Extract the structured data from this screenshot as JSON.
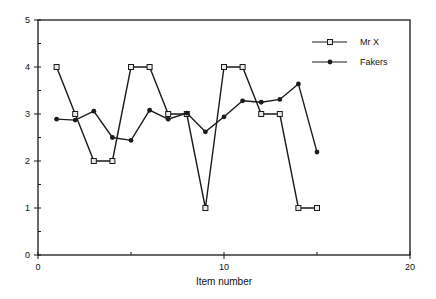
{
  "chart_data": {
    "type": "line",
    "title": "",
    "xlabel": "Item number",
    "ylabel": "",
    "xlim": [
      0,
      20
    ],
    "ylim": [
      0,
      5
    ],
    "x_ticks": [
      0,
      10,
      20
    ],
    "x_minor_ticks": [
      5,
      15
    ],
    "y_ticks": [
      0,
      1,
      2,
      3,
      4,
      5
    ],
    "y_minor_ticks": [
      0.5,
      1.5,
      2.5,
      3.5,
      4.5
    ],
    "grid": false,
    "legend_position": "upper right",
    "x": [
      1,
      2,
      3,
      4,
      5,
      6,
      7,
      8,
      9,
      10,
      11,
      12,
      13,
      14,
      15
    ],
    "series": [
      {
        "name": "Mr X",
        "marker": "open-square",
        "values": [
          4,
          3,
          2,
          2,
          4,
          4,
          3,
          3,
          1,
          4,
          4,
          3,
          3,
          1,
          1
        ]
      },
      {
        "name": "Fakers",
        "marker": "filled-circle",
        "values": [
          2.89,
          2.87,
          3.06,
          2.5,
          2.44,
          3.08,
          2.89,
          3.02,
          2.62,
          2.94,
          3.28,
          3.25,
          3.31,
          3.64,
          2.19
        ]
      }
    ]
  },
  "colors": {
    "line": "#1a1a1a",
    "background": "#ffffff",
    "marker_fill_open": "#e8e8e8"
  }
}
